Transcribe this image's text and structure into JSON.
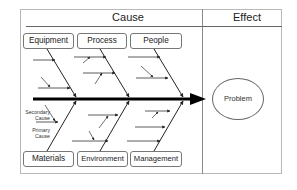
{
  "header": {
    "cause_label": "Cause",
    "effect_label": "Effect"
  },
  "categories": {
    "top": [
      {
        "label": "Equipment"
      },
      {
        "label": "Process"
      },
      {
        "label": "People"
      }
    ],
    "bottom": [
      {
        "label": "Materials"
      },
      {
        "label": "Environment"
      },
      {
        "label": "Management"
      }
    ]
  },
  "annotations": {
    "secondary_cause": "Secondary Cause",
    "secondary_line1": "Secondary",
    "secondary_line2": "Cause",
    "primary_line1": "Primary",
    "primary_line2": "Cause"
  },
  "effect": {
    "label": "Problem"
  },
  "colors": {
    "line": "#222222",
    "spine": "#000000",
    "border": "#777777"
  }
}
